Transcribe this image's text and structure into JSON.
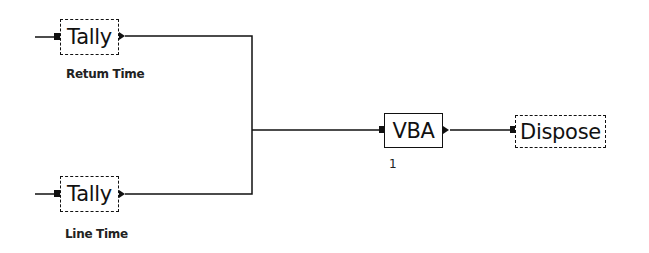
{
  "diagram": {
    "type": "simulation-flowchart",
    "modules": [
      {
        "id": "tally1",
        "label": "Tally",
        "caption": "Retum Time"
      },
      {
        "id": "tally2",
        "label": "Tally",
        "caption": "Line Time"
      },
      {
        "id": "vba",
        "label": "VBA",
        "caption": "1"
      },
      {
        "id": "dispose",
        "label": "Dispose",
        "caption": ""
      }
    ],
    "connections": [
      {
        "from": "tally1",
        "to": "vba"
      },
      {
        "from": "tally2",
        "to": "vba"
      },
      {
        "from": "vba",
        "to": "dispose"
      }
    ],
    "colors": {
      "background": "#ffffff",
      "stroke": "#111111"
    }
  }
}
